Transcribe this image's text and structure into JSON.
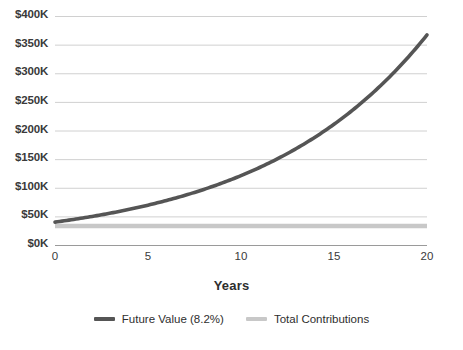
{
  "chart_data": {
    "type": "line",
    "title": "",
    "xlabel": "Years",
    "ylabel": "",
    "xlim": [
      0,
      20
    ],
    "ylim": [
      0,
      400000
    ],
    "grid": true,
    "legend_position": "bottom",
    "x_tick_labels": [
      "0",
      "5",
      "10",
      "15",
      "20"
    ],
    "x_ticks": [
      0,
      5,
      10,
      15,
      20
    ],
    "y_tick_labels": [
      "$0K",
      "$50K",
      "$100K",
      "$150K",
      "$200K",
      "$250K",
      "$300K",
      "$350K",
      "$400K"
    ],
    "y_ticks": [
      0,
      50000,
      100000,
      150000,
      200000,
      250000,
      300000,
      350000,
      400000
    ],
    "x": [
      0,
      1,
      2,
      3,
      4,
      5,
      6,
      7,
      8,
      9,
      10,
      11,
      12,
      13,
      14,
      15,
      16,
      17,
      18,
      19,
      20
    ],
    "series": [
      {
        "name": "Future Value (8.2%)",
        "color": "#555555",
        "width": 3.6,
        "values": [
          40000,
          51600,
          64100,
          77600,
          92300,
          108200,
          125400,
          144000,
          164200,
          186000,
          209600,
          235100,
          262700,
          292500,
          324700,
          359500,
          397100,
          437700,
          481600,
          529100,
          367000
        ]
      },
      {
        "name": "Total Contributions",
        "color": "#c8c8c8",
        "width": 4.5,
        "values": [
          33000,
          33000,
          33000,
          33000,
          33000,
          33000,
          33000,
          33000,
          33000,
          33000,
          33000,
          33000,
          33000,
          33000,
          33000,
          33000,
          33000,
          33000,
          33000,
          33000,
          33000
        ]
      }
    ],
    "future_value_curve": {
      "start_value": 40000,
      "end_value": 367000,
      "rate_percent": 8.2
    },
    "contributions_level": 33000
  },
  "legend": {
    "items": [
      {
        "label": "Future Value (8.2%)",
        "color": "#555555"
      },
      {
        "label": "Total Contributions",
        "color": "#c8c8c8"
      }
    ]
  },
  "axes": {
    "x_title": "Years",
    "grid_color": "#d0d0d0",
    "axis_color": "#9a9a9a",
    "tick_text_color": "#3a3a3a"
  }
}
